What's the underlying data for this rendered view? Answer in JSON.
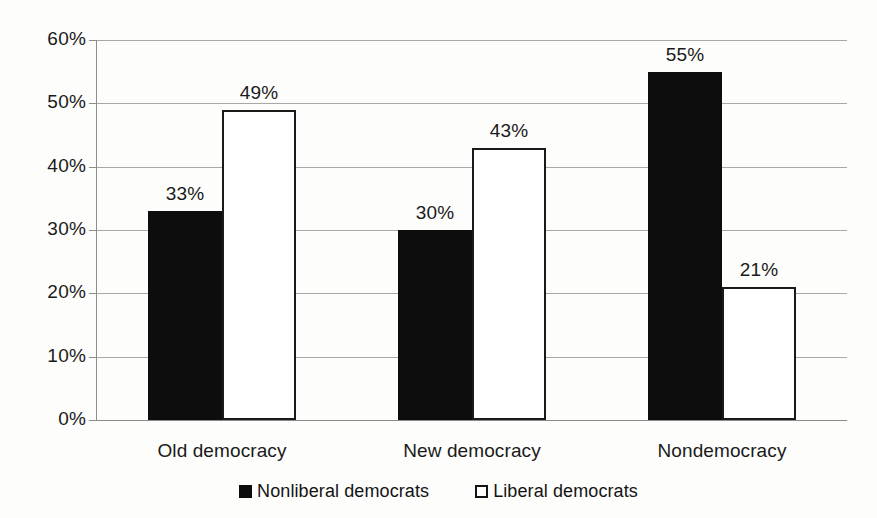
{
  "chart_data": {
    "type": "bar",
    "title": "",
    "xlabel": "",
    "ylabel": "",
    "ylim": [
      0,
      60
    ],
    "grid": true,
    "legend_position": "bottom-center",
    "categories": [
      "Old democracy",
      "New democracy",
      "Nondemocracy"
    ],
    "y_ticks": [
      "0%",
      "10%",
      "20%",
      "30%",
      "40%",
      "50%",
      "60%"
    ],
    "y_tick_values": [
      0,
      10,
      20,
      30,
      40,
      50,
      60
    ],
    "series": [
      {
        "name": "Nonliberal democrats",
        "style": "filled-black",
        "color": "#0d0d0d",
        "values": [
          33,
          30,
          55
        ],
        "labels": [
          "33%",
          "43%",
          "55%"
        ],
        "value_labels": [
          "33%",
          "30%",
          "55%"
        ]
      },
      {
        "name": "Liberal democrats",
        "style": "white-outline",
        "color": "#ffffff",
        "border_color": "#1a1a1a",
        "values": [
          49,
          43,
          21
        ],
        "value_labels": [
          "49%",
          "43%",
          "21%"
        ]
      }
    ]
  },
  "legend": {
    "items": [
      {
        "label": "Nonliberal democrats",
        "swatch": "filled-square-black"
      },
      {
        "label": "Liberal democrats",
        "swatch": "outline-square-white"
      }
    ]
  },
  "colors": {
    "background": "#fdfdfc",
    "gridline": "#a8a8a8",
    "axis": "#8d8d8d",
    "text": "#1a1a1a",
    "series_dark": "#0d0d0d",
    "series_light": "#ffffff"
  }
}
